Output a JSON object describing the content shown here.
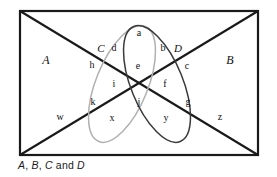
{
  "figure": {
    "type": "venn-diagram",
    "title": "",
    "caption": {
      "full": "A, B, C and D",
      "parts": [
        "A",
        "B",
        "C",
        "and",
        "D"
      ]
    },
    "universe_shape": "rectangle",
    "colors": {
      "rectangle_stroke": "#1a1a1a",
      "diagonal_stroke": "#1a1a1a",
      "ellipse_c_stroke": "#b0b0b0",
      "ellipse_d_stroke": "#3a3a3a",
      "label_color": "#111111",
      "background": "#ffffff"
    },
    "set_labels": [
      {
        "id": "set-a",
        "text": "A",
        "x": 46,
        "y": 60
      },
      {
        "id": "set-b",
        "text": "B",
        "x": 230,
        "y": 60
      },
      {
        "id": "set-c",
        "text": "C",
        "x": 101,
        "y": 48
      },
      {
        "id": "set-d",
        "text": "D",
        "x": 178,
        "y": 48
      }
    ],
    "region_labels": [
      {
        "id": "region-a",
        "text": "a",
        "x": 139,
        "y": 33
      },
      {
        "id": "region-d",
        "text": "d",
        "x": 114,
        "y": 48
      },
      {
        "id": "region-b",
        "text": "b",
        "x": 163,
        "y": 48
      },
      {
        "id": "region-h",
        "text": "h",
        "x": 92,
        "y": 65
      },
      {
        "id": "region-e",
        "text": "e",
        "x": 138,
        "y": 66
      },
      {
        "id": "region-c-lower",
        "text": "c",
        "x": 187,
        "y": 66
      },
      {
        "id": "region-i",
        "text": "i",
        "x": 114,
        "y": 84
      },
      {
        "id": "region-f",
        "text": "f",
        "x": 165,
        "y": 84
      },
      {
        "id": "region-k",
        "text": "k",
        "x": 93,
        "y": 102
      },
      {
        "id": "region-j",
        "text": "j",
        "x": 139,
        "y": 102
      },
      {
        "id": "region-g",
        "text": "g",
        "x": 188,
        "y": 102
      },
      {
        "id": "region-w",
        "text": "w",
        "x": 60,
        "y": 117
      },
      {
        "id": "region-x",
        "text": "x",
        "x": 112,
        "y": 118
      },
      {
        "id": "region-y",
        "text": "y",
        "x": 166,
        "y": 118
      },
      {
        "id": "region-z",
        "text": "z",
        "x": 220,
        "y": 117
      }
    ],
    "geometry": {
      "rect": {
        "x": 20,
        "y": 11,
        "width": 238,
        "height": 144
      },
      "diagonals": [
        {
          "id": "diagonal-tl-br",
          "x1": 20,
          "y1": 11,
          "x2": 258,
          "y2": 155
        },
        {
          "id": "diagonal-bl-tr",
          "x1": 20,
          "y1": 155,
          "x2": 258,
          "y2": 11
        }
      ],
      "ellipse_c": {
        "cx": 122,
        "cy": 84,
        "rx": 26,
        "ry": 62,
        "rotation": 22
      },
      "ellipse_d": {
        "cx": 157,
        "cy": 84,
        "rx": 26,
        "ry": 62,
        "rotation": -22
      }
    }
  }
}
